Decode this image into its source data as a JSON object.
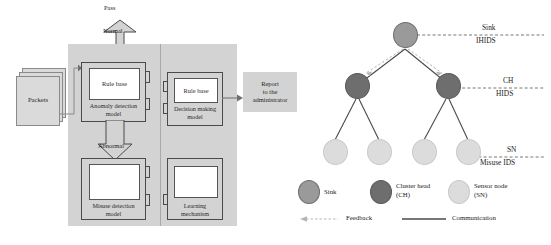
{
  "figure": {
    "left_diagram": {
      "name": "hybrid-intrusion-detection-architecture",
      "input": {
        "label": "Packets"
      },
      "pass_label": "Pass",
      "normal_label": "Normal",
      "abnormal_label": "Abnormal",
      "modules": [
        {
          "id": "anomaly",
          "inner_label": "Rule base",
          "outer_label_line1": "Anomaly detection",
          "outer_label_line2": "model"
        },
        {
          "id": "decision",
          "inner_label": "Rule base",
          "outer_label_line1": "Decision making",
          "outer_label_line2": "model"
        },
        {
          "id": "misuse",
          "inner_label": "",
          "outer_label_line1": "Misuse detection",
          "outer_label_line2": "model"
        },
        {
          "id": "learning",
          "inner_label": "",
          "outer_label_line1": "Learning",
          "outer_label_line2": "mechanism"
        }
      ],
      "output": {
        "line1": "Report",
        "line2": "to the",
        "line3": "administrator"
      }
    },
    "right_diagram": {
      "name": "wsn-hierarchical-ids-topology",
      "tiers": [
        {
          "id": "sink",
          "top_label": "Sink",
          "bottom_label": "IHIDS"
        },
        {
          "id": "ch",
          "top_label": "CH",
          "bottom_label": "HIDS"
        },
        {
          "id": "sn",
          "top_label": "SN",
          "bottom_label": "Misuse IDS"
        }
      ],
      "legend_nodes": [
        {
          "id": "sink",
          "line1": "Sink",
          "line2": "",
          "color": "#9a9a9a"
        },
        {
          "id": "ch",
          "line1": "Cluster head",
          "line2": "(CH)",
          "color": "#6e6e6e"
        },
        {
          "id": "sn",
          "line1": "Sensor node",
          "line2": "(SN)",
          "color": "#dcdcdc"
        }
      ],
      "legend_lines": [
        {
          "id": "feedback",
          "label": "Feedback",
          "style": "dashed-arrow",
          "color": "#b0b0b0"
        },
        {
          "id": "communication",
          "label": "Communication",
          "style": "solid",
          "color": "#4a4a4a"
        }
      ]
    }
  },
  "colors": {
    "panel_gray": "#d3d3d3",
    "sink_gray": "#9a9a9a",
    "ch_gray": "#6e6e6e",
    "sn_gray": "#dcdcdc",
    "line_dark": "#4a4a4a",
    "feedback_gray": "#b0b0b0"
  }
}
